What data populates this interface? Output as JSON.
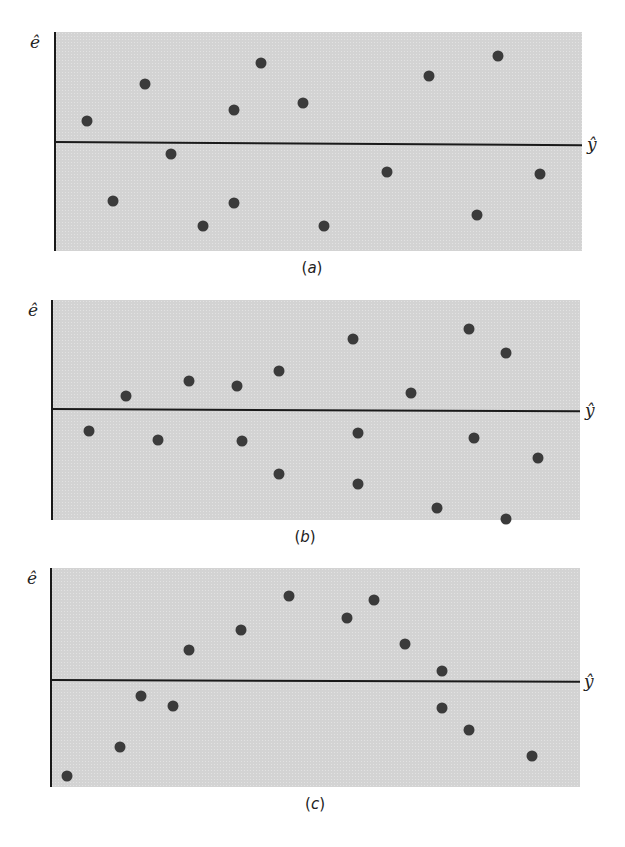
{
  "figure": {
    "panels": [
      {
        "id": "a",
        "caption_open": "(",
        "caption_letter": "a",
        "caption_close": ")",
        "y_axis_label": "ê",
        "x_axis_label": "ŷ"
      },
      {
        "id": "b",
        "caption_open": "(",
        "caption_letter": "b",
        "caption_close": ")",
        "y_axis_label": "ê",
        "x_axis_label": "ŷ"
      },
      {
        "id": "c",
        "caption_open": "(",
        "caption_letter": "c",
        "caption_close": ")",
        "y_axis_label": "ê",
        "x_axis_label": "ŷ"
      }
    ],
    "colors": {
      "plot_bg": "#d3d3d3",
      "dot": "#3b3b3b",
      "axis": "#1a1a1a"
    }
  },
  "chart_data": [
    {
      "type": "scatter",
      "title": "(a)",
      "xlabel": "ŷ",
      "ylabel": "ê",
      "grid": false,
      "legend": null,
      "note": "Residuals vs fitted values; horizontal band of random scatter around zero (no pattern). Units arbitrary; x scaled 0–100, y scaled -100 to 100 relative to zero line.",
      "xlim": [
        0,
        100
      ],
      "ylim": [
        -100,
        100
      ],
      "box": {
        "left": 55,
        "right": 582,
        "top": 32,
        "bottom": 251,
        "zero_y": 143
      },
      "points": [
        {
          "x": 6,
          "y": 20
        },
        {
          "x": 11,
          "y": -54
        },
        {
          "x": 17,
          "y": 53
        },
        {
          "x": 22,
          "y": -10
        },
        {
          "x": 28,
          "y": -77
        },
        {
          "x": 34,
          "y": 30
        },
        {
          "x": 34,
          "y": -56
        },
        {
          "x": 39,
          "y": 72
        },
        {
          "x": 47,
          "y": 36
        },
        {
          "x": 51,
          "y": -77
        },
        {
          "x": 63,
          "y": -27
        },
        {
          "x": 71,
          "y": 60
        },
        {
          "x": 80,
          "y": -67
        },
        {
          "x": 84,
          "y": 78
        },
        {
          "x": 92,
          "y": -29
        }
      ]
    },
    {
      "type": "scatter",
      "title": "(b)",
      "xlabel": "ŷ",
      "ylabel": "ê",
      "grid": false,
      "legend": null,
      "note": "Residuals vs fitted values; spread widens as ŷ increases (funnel / heteroscedastic pattern).",
      "xlim": [
        0,
        100
      ],
      "ylim": [
        -100,
        100
      ],
      "box": {
        "left": 52,
        "right": 580,
        "top": 300,
        "bottom": 520,
        "zero_y": 409
      },
      "points": [
        {
          "x": 7,
          "y": -20
        },
        {
          "x": 14,
          "y": 12
        },
        {
          "x": 20,
          "y": -28
        },
        {
          "x": 26,
          "y": 26
        },
        {
          "x": 35,
          "y": 21
        },
        {
          "x": 36,
          "y": -29
        },
        {
          "x": 43,
          "y": 35
        },
        {
          "x": 43,
          "y": -59
        },
        {
          "x": 57,
          "y": 64
        },
        {
          "x": 58,
          "y": -22
        },
        {
          "x": 58,
          "y": -68
        },
        {
          "x": 68,
          "y": 15
        },
        {
          "x": 73,
          "y": -89
        },
        {
          "x": 79,
          "y": 73
        },
        {
          "x": 80,
          "y": -26
        },
        {
          "x": 86,
          "y": 51
        },
        {
          "x": 86,
          "y": -99
        },
        {
          "x": 92,
          "y": -44
        }
      ]
    },
    {
      "type": "scatter",
      "title": "(c)",
      "xlabel": "ŷ",
      "ylabel": "ê",
      "grid": false,
      "legend": null,
      "note": "Residuals vs fitted values; curved (inverted-U) pattern indicating nonlinearity.",
      "xlim": [
        0,
        100
      ],
      "ylim": [
        -100,
        100
      ],
      "box": {
        "left": 51,
        "right": 580,
        "top": 568,
        "bottom": 787,
        "zero_y": 680
      },
      "points": [
        {
          "x": 3,
          "y": -90
        },
        {
          "x": 13,
          "y": -63
        },
        {
          "x": 17,
          "y": -15
        },
        {
          "x": 23,
          "y": -24
        },
        {
          "x": 26,
          "y": 27
        },
        {
          "x": 36,
          "y": 45
        },
        {
          "x": 45,
          "y": 75
        },
        {
          "x": 56,
          "y": 55
        },
        {
          "x": 61,
          "y": 71
        },
        {
          "x": 67,
          "y": 32
        },
        {
          "x": 74,
          "y": 8
        },
        {
          "x": 74,
          "y": -26
        },
        {
          "x": 79,
          "y": -47
        },
        {
          "x": 91,
          "y": -71
        }
      ]
    }
  ]
}
